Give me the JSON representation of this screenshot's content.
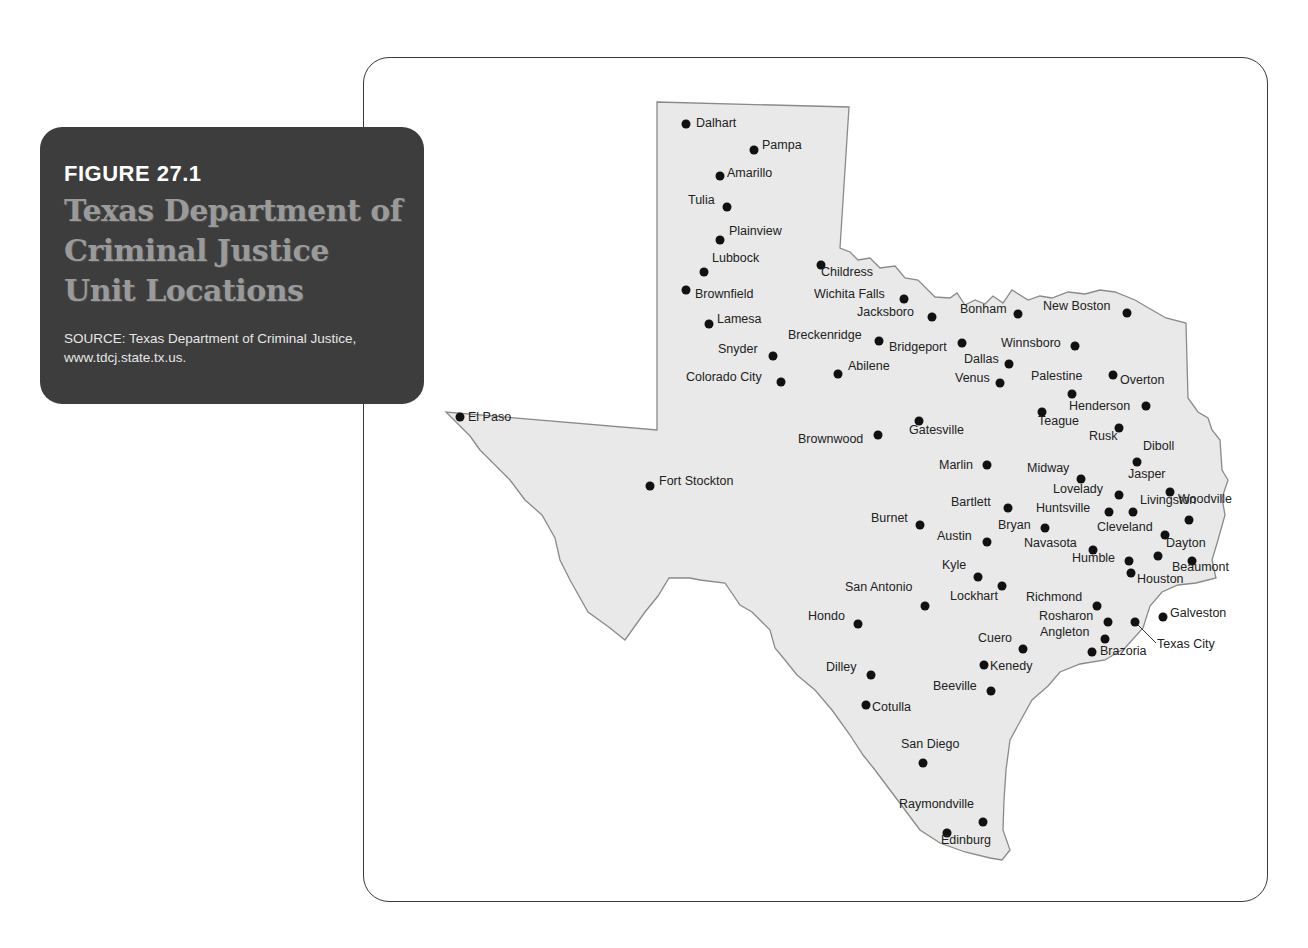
{
  "caption": {
    "figure_label": "FIGURE 27.1",
    "title": "Texas Department of Criminal Justice Unit Locations",
    "source": "SOURCE: Texas Department of Criminal Justice, www.tdcj.state.tx.us."
  },
  "colors": {
    "caption_bg": "#3d3d3d",
    "caption_title": "#9a9a9a",
    "state_fill": "#e9e9e9",
    "state_outline": "#8a8a8a",
    "dot": "#111111",
    "frame": "#3a3a3a"
  },
  "map": {
    "region": "Texas",
    "marker_type": "unit-location",
    "cities": [
      {
        "name": "Dalhart",
        "dot": [
          686,
          124
        ],
        "label": [
          696,
          122
        ]
      },
      {
        "name": "Pampa",
        "dot": [
          754,
          150
        ],
        "label": [
          762,
          144
        ]
      },
      {
        "name": "Amarillo",
        "dot": [
          720,
          176
        ],
        "label": [
          727,
          172
        ]
      },
      {
        "name": "Tulia",
        "dot": [
          727,
          207
        ],
        "label": [
          688,
          199
        ]
      },
      {
        "name": "Plainview",
        "dot": [
          720,
          240
        ],
        "label": [
          729,
          230
        ]
      },
      {
        "name": "Lubbock",
        "dot": [
          704,
          272
        ],
        "label": [
          712,
          257
        ]
      },
      {
        "name": "Brownfield",
        "dot": [
          686,
          290
        ],
        "label": [
          695,
          293
        ]
      },
      {
        "name": "Lamesa",
        "dot": [
          709,
          324
        ],
        "label": [
          717,
          318
        ]
      },
      {
        "name": "Snyder",
        "dot": [
          773,
          356
        ],
        "label": [
          718,
          348
        ]
      },
      {
        "name": "Colorado City",
        "dot": [
          781,
          382
        ],
        "label": [
          686,
          376
        ]
      },
      {
        "name": "Childress",
        "dot": [
          821,
          265
        ],
        "label": [
          821,
          271
        ]
      },
      {
        "name": "Wichita Falls",
        "dot": [
          904,
          299
        ],
        "label": [
          814,
          293
        ]
      },
      {
        "name": "Jacksboro",
        "dot": [
          932,
          317
        ],
        "label": [
          857,
          311
        ]
      },
      {
        "name": "Breckenridge",
        "dot": [
          879,
          341
        ],
        "label": [
          788,
          334
        ]
      },
      {
        "name": "Abilene",
        "dot": [
          838,
          374
        ],
        "label": [
          848,
          365
        ]
      },
      {
        "name": "Bridgeport",
        "dot": [
          962,
          343
        ],
        "label": [
          889,
          346
        ]
      },
      {
        "name": "Bonham",
        "dot": [
          1018,
          314
        ],
        "label": [
          960,
          308
        ]
      },
      {
        "name": "New Boston",
        "dot": [
          1127,
          313
        ],
        "label": [
          1043,
          305
        ]
      },
      {
        "name": "Winnsboro",
        "dot": [
          1075,
          346
        ],
        "label": [
          1001,
          342
        ]
      },
      {
        "name": "Dallas",
        "dot": [
          1009,
          364
        ],
        "label": [
          964,
          358
        ]
      },
      {
        "name": "Venus",
        "dot": [
          1000,
          383
        ],
        "label": [
          955,
          377
        ]
      },
      {
        "name": "Palestine",
        "dot": [
          1072,
          394
        ],
        "label": [
          1031,
          375
        ]
      },
      {
        "name": "Overton",
        "dot": [
          1113,
          375
        ],
        "label": [
          1120,
          379
        ]
      },
      {
        "name": "Teague",
        "dot": [
          1042,
          412
        ],
        "label": [
          1038,
          420
        ]
      },
      {
        "name": "Henderson",
        "dot": [
          1146,
          406
        ],
        "label": [
          1069,
          405
        ]
      },
      {
        "name": "Rusk",
        "dot": [
          1119,
          428
        ],
        "label": [
          1089,
          435
        ]
      },
      {
        "name": "Diboll",
        "dot": [
          1137,
          462
        ],
        "label": [
          1143,
          445
        ]
      },
      {
        "name": "Gatesville",
        "dot": [
          919,
          421
        ],
        "label": [
          909,
          429
        ]
      },
      {
        "name": "Brownwood",
        "dot": [
          878,
          435
        ],
        "label": [
          798,
          438
        ]
      },
      {
        "name": "Marlin",
        "dot": [
          987,
          465
        ],
        "label": [
          939,
          464
        ]
      },
      {
        "name": "Midway",
        "dot": [
          1081,
          479
        ],
        "label": [
          1027,
          467
        ]
      },
      {
        "name": "Jasper",
        "dot": [
          1170,
          492
        ],
        "label": [
          1128,
          473
        ]
      },
      {
        "name": "Lovelady",
        "dot": [
          1119,
          495
        ],
        "label": [
          1053,
          488
        ]
      },
      {
        "name": "Huntsville",
        "dot": [
          1109,
          512
        ],
        "label": [
          1036,
          507
        ]
      },
      {
        "name": "Livingston",
        "dot": [
          1133,
          512
        ],
        "label": [
          1140,
          499
        ]
      },
      {
        "name": "Bartlett",
        "dot": [
          1008,
          508
        ],
        "label": [
          951,
          501
        ]
      },
      {
        "name": "Bryan",
        "dot": [
          1045,
          528
        ],
        "label": [
          998,
          524
        ]
      },
      {
        "name": "Burnet",
        "dot": [
          920,
          525
        ],
        "label": [
          871,
          517
        ]
      },
      {
        "name": "Woodville",
        "dot": [
          1189,
          520
        ],
        "label": [
          1178,
          498
        ]
      },
      {
        "name": "Cleveland",
        "dot": [
          1165,
          535
        ],
        "label": [
          1097,
          526
        ]
      },
      {
        "name": "Austin",
        "dot": [
          987,
          542
        ],
        "label": [
          937,
          535
        ]
      },
      {
        "name": "Navasota",
        "dot": [
          1093,
          550
        ],
        "label": [
          1024,
          542
        ]
      },
      {
        "name": "Dayton",
        "dot": [
          1158,
          556
        ],
        "label": [
          1166,
          542
        ]
      },
      {
        "name": "Humble",
        "dot": [
          1129,
          561
        ],
        "label": [
          1072,
          557
        ]
      },
      {
        "name": "Beaumont",
        "dot": [
          1192,
          561
        ],
        "label": [
          1172,
          566
        ]
      },
      {
        "name": "Houston",
        "dot": [
          1131,
          573
        ],
        "label": [
          1137,
          578
        ]
      },
      {
        "name": "Kyle",
        "dot": [
          978,
          577
        ],
        "label": [
          942,
          564
        ]
      },
      {
        "name": "Lockhart",
        "dot": [
          1002,
          586
        ],
        "label": [
          950,
          595
        ]
      },
      {
        "name": "San Antonio",
        "dot": [
          925,
          606
        ],
        "label": [
          845,
          586
        ]
      },
      {
        "name": "Richmond",
        "dot": [
          1097,
          606
        ],
        "label": [
          1026,
          596
        ]
      },
      {
        "name": "Hondo",
        "dot": [
          858,
          624
        ],
        "label": [
          808,
          615
        ]
      },
      {
        "name": "Rosharon",
        "dot": [
          1108,
          622
        ],
        "label": [
          1039,
          615
        ]
      },
      {
        "name": "Galveston",
        "dot": [
          1163,
          617
        ],
        "label": [
          1170,
          612
        ]
      },
      {
        "name": "Angleton",
        "dot": [
          1105,
          639
        ],
        "label": [
          1040,
          631
        ]
      },
      {
        "name": "Texas City",
        "dot": [
          1135,
          622
        ],
        "label": [
          1157,
          643
        ]
      },
      {
        "name": "Cuero",
        "dot": [
          1023,
          649
        ],
        "label": [
          978,
          637
        ]
      },
      {
        "name": "Brazoria",
        "dot": [
          1092,
          652
        ],
        "label": [
          1100,
          650
        ]
      },
      {
        "name": "Kenedy",
        "dot": [
          984,
          665
        ],
        "label": [
          990,
          665
        ]
      },
      {
        "name": "Dilley",
        "dot": [
          871,
          675
        ],
        "label": [
          826,
          666
        ]
      },
      {
        "name": "Beeville",
        "dot": [
          991,
          691
        ],
        "label": [
          933,
          685
        ]
      },
      {
        "name": "Cotulla",
        "dot": [
          866,
          705
        ],
        "label": [
          872,
          706
        ]
      },
      {
        "name": "San Diego",
        "dot": [
          923,
          763
        ],
        "label": [
          901,
          743
        ]
      },
      {
        "name": "Raymondville",
        "dot": [
          983,
          822
        ],
        "label": [
          899,
          803
        ]
      },
      {
        "name": "Edinburg",
        "dot": [
          947,
          833
        ],
        "label": [
          941,
          839
        ]
      },
      {
        "name": "El Paso",
        "dot": [
          460,
          417
        ],
        "label": [
          468,
          416
        ]
      },
      {
        "name": "Fort Stockton",
        "dot": [
          650,
          486
        ],
        "label": [
          659,
          480
        ]
      }
    ]
  }
}
